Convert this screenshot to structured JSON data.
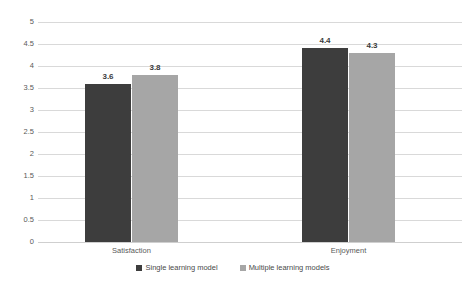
{
  "chart_data": {
    "type": "bar",
    "title": "",
    "subtitle": "",
    "xlabel": "",
    "ylabel": "",
    "categories": [
      "Satisfaction",
      "Enjoyment"
    ],
    "series": [
      {
        "name": "Single learning model",
        "values": [
          3.6,
          4.4
        ],
        "color": "#3d3d3d"
      },
      {
        "name": "Multiple learning models",
        "values": [
          3.8,
          4.3
        ],
        "color": "#a6a6a6"
      }
    ],
    "ylim": [
      0,
      5
    ],
    "ytick_step": 0.5,
    "yticks": [
      "5",
      "4.5",
      "4",
      "3.5",
      "3",
      "2.5",
      "2",
      "1.5",
      "1",
      "0.5",
      "0"
    ],
    "data_labels": [
      "3.6",
      "3.8",
      "4.4",
      "4.3"
    ],
    "grid": {
      "horizontal": true,
      "vertical": false,
      "color": "#d9d9d9"
    },
    "legend": {
      "position": "bottom",
      "entries": [
        "Single learning model",
        "Multiple learning models"
      ]
    },
    "background": "#ffffff"
  },
  "axis": {
    "yticks": [
      {
        "label": "5",
        "value": 5.0
      },
      {
        "label": "4.5",
        "value": 4.5
      },
      {
        "label": "4",
        "value": 4.0
      },
      {
        "label": "3.5",
        "value": 3.5
      },
      {
        "label": "3",
        "value": 3.0
      },
      {
        "label": "2.5",
        "value": 2.5
      },
      {
        "label": "2",
        "value": 2.0
      },
      {
        "label": "1.5",
        "value": 1.5
      },
      {
        "label": "1",
        "value": 1.0
      },
      {
        "label": "0.5",
        "value": 0.5
      },
      {
        "label": "0",
        "value": 0.0
      }
    ],
    "xticks": [
      {
        "label": "Satisfaction"
      },
      {
        "label": "Enjoyment"
      }
    ]
  },
  "bars": [
    {
      "name": "satisfaction-single",
      "group": "Satisfaction",
      "series": "Single learning model",
      "value": 3.6,
      "label": "3.6",
      "color": "#3d3d3d",
      "x": 47
    },
    {
      "name": "satisfaction-multiple",
      "group": "Satisfaction",
      "series": "Multiple learning models",
      "value": 3.8,
      "label": "3.8",
      "color": "#a6a6a6",
      "x": 94
    },
    {
      "name": "enjoyment-single",
      "group": "Enjoyment",
      "series": "Single learning model",
      "value": 4.4,
      "label": "4.4",
      "color": "#3d3d3d",
      "x": 264
    },
    {
      "name": "enjoyment-multiple",
      "group": "Enjoyment",
      "series": "Multiple learning models",
      "value": 4.3,
      "label": "4.3",
      "color": "#a6a6a6",
      "x": 311
    }
  ],
  "legend": {
    "items": [
      {
        "label": "Single learning model",
        "color": "#3d3d3d"
      },
      {
        "label": "Multiple learning models",
        "color": "#a6a6a6"
      }
    ]
  }
}
